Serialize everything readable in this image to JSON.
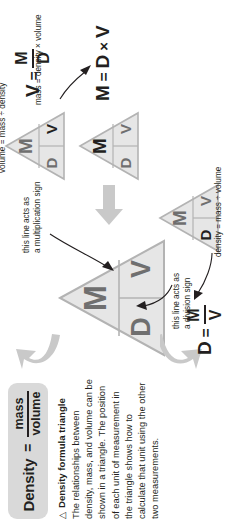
{
  "figure": {
    "title_formula": {
      "subject": "Density",
      "equals": "=",
      "numerator": "mass",
      "denominator": "volume"
    },
    "caption": {
      "bullet": "△",
      "title": "Density formula triangle",
      "body": "The relationships between density, mass, and volume can be shown in a triangle. The position of each unit of measurement in the triangle shows how to calculate that unit using the other two measurements."
    },
    "central_triangle": {
      "name": "density-formula-triangle",
      "top": "M",
      "bottom_left": "D",
      "bottom_right": "V"
    },
    "annotations": {
      "division": "this line acts as\na division sign",
      "multiplication": "this line acts as\na multiplication sign"
    },
    "branches": [
      {
        "id": "mass",
        "triangle": {
          "top": "M",
          "bottom_left": "D",
          "bottom_right": "V",
          "highlight": "M"
        },
        "equation": {
          "lhs": "M",
          "equals": "=",
          "rhs_left": "D",
          "operator": "×",
          "rhs_right": "V"
        },
        "words": "mass = density × volume"
      },
      {
        "id": "volume",
        "triangle": {
          "top": "M",
          "bottom_left": "D",
          "bottom_right": "V",
          "highlight": "V"
        },
        "equation": {
          "lhs": "V",
          "equals": "=",
          "numerator": "M",
          "denominator": "D"
        },
        "words": "volume = mass ÷ density"
      },
      {
        "id": "density",
        "triangle": {
          "top": "M",
          "bottom_left": "D",
          "bottom_right": "V",
          "highlight": "D"
        },
        "equation": {
          "lhs": "D",
          "equals": "=",
          "numerator": "M",
          "denominator": "V"
        },
        "words": "density = mass ÷ volume"
      }
    ],
    "colors": {
      "panel_gray": "#d9d9d9",
      "triangle_fill": "#e6e6e6",
      "triangle_stroke": "#b3b3b3",
      "label_gray": "#6f6f6f",
      "ink": "#231f20",
      "arrow_gray": "#c9c9c9"
    }
  }
}
